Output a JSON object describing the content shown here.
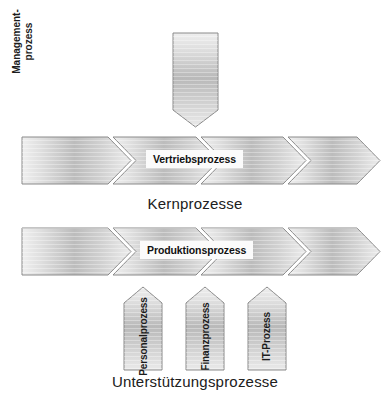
{
  "diagram": {
    "type": "process-map",
    "background_color": "#ffffff",
    "shape_fill_light": "#ededed",
    "shape_fill_mid": "#b8b8b8",
    "shape_stroke": "#8c8c8c",
    "text_color": "#1c1c1c"
  },
  "management": {
    "label_line1": "Management-",
    "label_line2": "prozess",
    "direction": "down"
  },
  "core_row": {
    "caption": "Kernprozesse",
    "callout": "Vertriebsprozess",
    "arrows": [
      {
        "label": ""
      },
      {
        "label": ""
      },
      {
        "label": ""
      },
      {
        "label": ""
      }
    ]
  },
  "second_row": {
    "callout": "Produktionsprozess",
    "arrows": [
      {
        "label": ""
      },
      {
        "label": ""
      },
      {
        "label": ""
      },
      {
        "label": ""
      }
    ]
  },
  "support": {
    "caption": "Unterstützungsprozesse",
    "arrows": [
      {
        "label": "Personalprozess"
      },
      {
        "label": "Finanzprozess"
      },
      {
        "label": "IT-Prozess"
      }
    ]
  }
}
